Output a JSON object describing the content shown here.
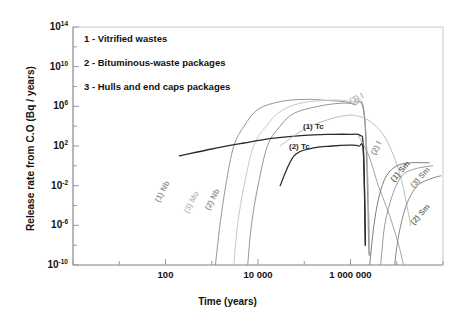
{
  "chart_data": {
    "type": "line",
    "title": "",
    "xlabel": "Time (years)",
    "ylabel": "Release rate from C.O (Bq / years)",
    "xscale": "log",
    "yscale": "log",
    "xlim": [
      1,
      100000000
    ],
    "ylim": [
      1e-10,
      100000000000000.0
    ],
    "grid": false,
    "legend_position": "top-left-inside",
    "xticks": [
      {
        "value": 100,
        "label": "100"
      },
      {
        "value": 10000,
        "label": "10 000"
      },
      {
        "value": 1000000,
        "label": "1 000 000"
      }
    ],
    "yticks": [
      {
        "value": 100000000000000.0,
        "label": "10",
        "exp": "14"
      },
      {
        "value": 10000000000.0,
        "label": "10",
        "exp": "10"
      },
      {
        "value": 1000000.0,
        "label": "10",
        "exp": "6"
      },
      {
        "value": 100.0,
        "label": "10",
        "exp": "2"
      },
      {
        "value": 0.01,
        "label": "10",
        "exp": "-2"
      },
      {
        "value": 1e-06,
        "label": "10",
        "exp": "-6"
      },
      {
        "value": 1e-10,
        "label": "10",
        "exp": "-10"
      }
    ],
    "legend_entries": [
      "1 - Vitrified wastes",
      "2 - Bituminous-waste packages",
      "3 - Hulls and end caps packages"
    ],
    "series": [
      {
        "name": "(1) Nb",
        "package": 1,
        "nuclide": "Nb",
        "color": "#8a8a8a",
        "label_rotation": -62,
        "points": [
          [
            1200,
            1e-10
          ],
          [
            1500,
            1e-06
          ],
          [
            2000,
            0.01
          ],
          [
            3000,
            100.0
          ],
          [
            5000,
            10000.0
          ],
          [
            10000,
            500000.0
          ],
          [
            30000,
            3000000.0
          ],
          [
            100000,
            5000000.0
          ],
          [
            300000,
            4000000.0
          ],
          [
            1000000,
            2000000.0
          ],
          [
            2000000,
            100000.0
          ],
          [
            2600000,
            1e-09
          ]
        ]
      },
      {
        "name": "(3) Mo",
        "package": 3,
        "nuclide": "Mo",
        "color": "#c2c2c2",
        "label_rotation": -62,
        "points": [
          [
            3000,
            1e-10
          ],
          [
            3600,
            1e-06
          ],
          [
            5000,
            0.01
          ],
          [
            8000,
            100.0
          ],
          [
            15000,
            10000.0
          ],
          [
            30000,
            300000.0
          ],
          [
            80000,
            2000000.0
          ],
          [
            300000,
            4000000.0
          ],
          [
            1000000,
            3000000.0
          ],
          [
            2000000,
            200000.0
          ],
          [
            2600000,
            1e-09
          ]
        ]
      },
      {
        "name": "(2) Nb",
        "package": 2,
        "nuclide": "Nb",
        "color": "#8a8a8a",
        "label_rotation": -62,
        "points": [
          [
            6000,
            1e-10
          ],
          [
            7200,
            1e-06
          ],
          [
            10000,
            0.01
          ],
          [
            16000,
            100.0
          ],
          [
            30000,
            10000.0
          ],
          [
            60000,
            200000.0
          ],
          [
            200000,
            1000000.0
          ],
          [
            600000,
            2000000.0
          ],
          [
            1200000,
            1500000.0
          ],
          [
            2000000,
            100000.0
          ],
          [
            2500000,
            1e-09
          ]
        ]
      },
      {
        "name": "(1) Tc",
        "package": 1,
        "nuclide": "Tc",
        "color": "#2b2b2b",
        "label_rotation": 0,
        "points": [
          [
            200,
            10.0
          ],
          [
            1000,
            50.0
          ],
          [
            5000,
            200.0
          ],
          [
            20000,
            600.0
          ],
          [
            100000,
            1200.0
          ],
          [
            400000,
            1500.0
          ],
          [
            1000000,
            1500.0
          ],
          [
            1600000,
            1200.0
          ],
          [
            1900000,
            50.0
          ],
          [
            2100000,
            1e-08
          ]
        ]
      },
      {
        "name": "(2) Tc",
        "package": 2,
        "nuclide": "Tc",
        "color": "#2b2b2b",
        "label_rotation": 0,
        "points": [
          [
            30000,
            0.01
          ],
          [
            60000,
            10.0
          ],
          [
            150000,
            60.0
          ],
          [
            400000,
            100.0
          ],
          [
            900000,
            120.0
          ],
          [
            1500000,
            100.0
          ],
          [
            1900000,
            20.0
          ],
          [
            2100000,
            1e-08
          ]
        ]
      },
      {
        "name": "(3) I",
        "package": 3,
        "nuclide": "I",
        "color": "#b5b5b5",
        "label_rotation": -28,
        "points": [
          [
            30000,
            100.0
          ],
          [
            100000,
            5000.0
          ],
          [
            300000,
            40000.0
          ],
          [
            800000,
            120000.0
          ],
          [
            1500000,
            100000.0
          ],
          [
            3000000,
            20000.0
          ],
          [
            6000000,
            400.0
          ],
          [
            12000000,
            0.1
          ],
          [
            20000000,
            1e-06
          ]
        ]
      },
      {
        "name": "(2) I",
        "package": 2,
        "nuclide": "I",
        "color": "#9a9a9a",
        "label_rotation": -66,
        "points": [
          [
            1500000,
            1000.0
          ],
          [
            2500000,
            10.0
          ],
          [
            4000000,
            0.01
          ],
          [
            7000000,
            1e-05
          ],
          [
            11000000,
            1e-08
          ],
          [
            14000000,
            1e-10
          ]
        ]
      },
      {
        "name": "(1) Sm",
        "package": 1,
        "nuclide": "Sm",
        "color": "#6e6e6e",
        "label_rotation": -48,
        "points": [
          [
            2600000,
            1e-10
          ],
          [
            3200000,
            1e-06
          ],
          [
            4200000,
            0.001
          ],
          [
            6000000,
            0.1
          ],
          [
            10000000,
            1.0
          ],
          [
            20000000,
            2.0
          ],
          [
            50000000,
            2.0
          ]
        ]
      },
      {
        "name": "(3) Sm",
        "package": 3,
        "nuclide": "Sm",
        "color": "#8e8e8e",
        "label_rotation": -48,
        "points": [
          [
            4500000,
            1e-10
          ],
          [
            5500000,
            1e-06
          ],
          [
            8000000,
            0.001
          ],
          [
            13000000,
            0.1
          ],
          [
            25000000,
            0.5
          ],
          [
            60000000,
            1.0
          ]
        ]
      },
      {
        "name": "(2) Sm",
        "package": 2,
        "nuclide": "Sm",
        "color": "#7a7a7a",
        "label_rotation": -48,
        "points": [
          [
            9000000,
            1e-10
          ],
          [
            11000000,
            1e-07
          ],
          [
            16000000,
            0.0001
          ],
          [
            28000000,
            0.01
          ],
          [
            55000000,
            0.05
          ],
          [
            90000000,
            0.1
          ]
        ]
      }
    ],
    "annotations": [
      {
        "text": "(1)  Nb",
        "x_px": 157,
        "y_px": 197,
        "rotate": -62,
        "color": "#9a9a9a"
      },
      {
        "text": "(3) Mo",
        "x_px": 186,
        "y_px": 208,
        "rotate": -62,
        "color": "#c2c2c2"
      },
      {
        "text": "(2)  Nb",
        "x_px": 207,
        "y_px": 205,
        "rotate": -62,
        "color": "#9a9a9a"
      },
      {
        "text": "(1)  Tc",
        "x_px": 303,
        "y_px": 122,
        "rotate": 0,
        "color": "#2b2b2b"
      },
      {
        "text": "(2) Tc",
        "x_px": 289,
        "y_px": 142,
        "rotate": 0,
        "color": "#2b2b2b"
      },
      {
        "text": "(3)  I",
        "x_px": 350,
        "y_px": 97,
        "rotate": -26,
        "color": "#b5b5b5"
      },
      {
        "text": "(2)  I",
        "x_px": 373,
        "y_px": 150,
        "rotate": -64,
        "color": "#9a9a9a"
      },
      {
        "text": "(1)  Sm",
        "x_px": 392,
        "y_px": 176,
        "rotate": -48,
        "color": "#6e6e6e"
      },
      {
        "text": "(3)  Sm",
        "x_px": 412,
        "y_px": 182,
        "rotate": -48,
        "color": "#8e8e8e"
      },
      {
        "text": "(2)  Sm",
        "x_px": 412,
        "y_px": 219,
        "rotate": -48,
        "color": "#7a7a7a"
      }
    ]
  },
  "axes": {
    "x_title": "Time (years)",
    "y_title": "Release rate from C.O (Bq / years)"
  },
  "legend": {
    "items": [
      {
        "label": "1 - Vitrified wastes"
      },
      {
        "label": "2 - Bituminous-waste packages"
      },
      {
        "label": "3 - Hulls and end caps packages"
      }
    ]
  }
}
